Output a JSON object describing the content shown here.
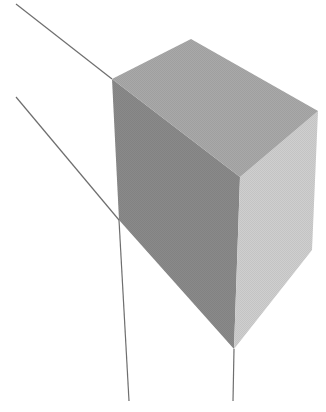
{
  "diagram": {
    "colors": {
      "background": "#ffffff",
      "top_face": "#a9a9a9",
      "left_face": "#8a8a8a",
      "right_face": "#cfcfcf",
      "lines": "#6e6e6e"
    }
  }
}
